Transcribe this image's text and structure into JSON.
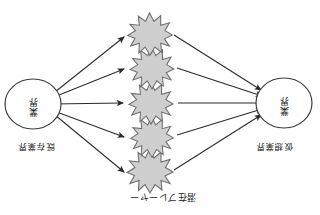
{
  "figure": {
    "caption_top": "潜在プレーヤー",
    "left_node": {
      "outer_label": "仮想業界",
      "text_lines": [
        "業",
        "界"
      ]
    },
    "right_node": {
      "outer_label": "既存業界",
      "text_lines": [
        "業",
        "界"
      ]
    },
    "burst_count": 5,
    "bursts": [
      {
        "label": ""
      },
      {
        "label": ""
      },
      {
        "label": ""
      },
      {
        "label": ""
      },
      {
        "label": ""
      }
    ],
    "colors": {
      "burst_fill": "#cfcfcf",
      "burst_stroke": "#6e6e6e",
      "circle_stroke": "#3a3a3a",
      "arrow": "#2a2a2a",
      "background": "#ffffff",
      "text": "#1c1c1c"
    }
  }
}
